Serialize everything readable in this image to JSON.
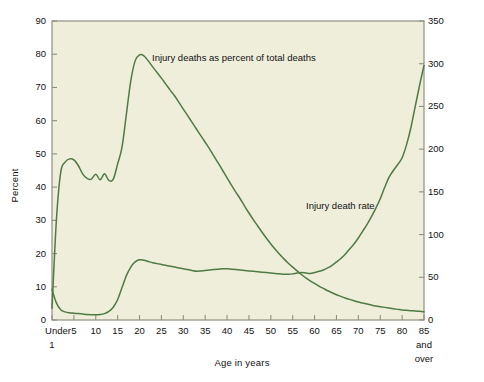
{
  "figure": {
    "background_color": "#ffffff",
    "plot_background_color": "#efeedb",
    "plot_border_color": "#8f8f82",
    "line_color": "#4e7a43"
  },
  "axes": {
    "left": {
      "title": "Percent",
      "ticks": [
        "0",
        "10",
        "20",
        "30",
        "40",
        "50",
        "60",
        "70",
        "80",
        "90"
      ],
      "min": 0,
      "max": 90
    },
    "right": {
      "title": "Deaths per 100,000 population",
      "ticks": [
        "0",
        "50",
        "100",
        "150",
        "200",
        "250",
        "300",
        "350"
      ],
      "min": 0,
      "max": 350
    },
    "bottom": {
      "title": "Age in years",
      "ticks": [
        "Under 1",
        "5",
        "10",
        "15",
        "20",
        "25",
        "30",
        "35",
        "40",
        "45",
        "50",
        "55",
        "60",
        "65",
        "70",
        "75",
        "80",
        "85 and over"
      ]
    }
  },
  "annotations": [
    {
      "name": "percent-series-label",
      "text": "Injury deaths as percent of total deaths"
    },
    {
      "name": "rate-series-label",
      "text": "Injury death rate"
    }
  ],
  "chart_data": {
    "type": "line",
    "title": "",
    "xlabel": "Age in years",
    "ylabel": "Percent",
    "ylabel_secondary": "Deaths per 100,000 population",
    "ylim": [
      0,
      90
    ],
    "ylim_secondary": [
      0,
      350
    ],
    "grid": false,
    "legend": "inline annotations",
    "x": [
      0,
      1,
      2,
      3,
      4,
      5,
      6,
      7,
      8,
      9,
      10,
      11,
      12,
      13,
      14,
      15,
      16,
      17,
      18,
      19,
      20,
      21,
      22,
      23,
      24,
      25,
      26,
      27,
      28,
      29,
      30,
      31,
      32,
      33,
      34,
      35,
      36,
      37,
      38,
      39,
      40,
      41,
      42,
      43,
      44,
      45,
      46,
      47,
      48,
      49,
      50,
      51,
      52,
      53,
      54,
      55,
      56,
      57,
      58,
      59,
      60,
      61,
      62,
      63,
      64,
      65,
      66,
      67,
      68,
      69,
      70,
      71,
      72,
      73,
      74,
      75,
      76,
      77,
      78,
      79,
      80,
      81,
      82,
      83,
      84,
      85
    ],
    "x_tick_labels": [
      "Under 1",
      "5",
      "10",
      "15",
      "20",
      "25",
      "30",
      "35",
      "40",
      "45",
      "50",
      "55",
      "60",
      "65",
      "70",
      "75",
      "80",
      "85 and over"
    ],
    "series": [
      {
        "name": "Injury deaths as percent of total deaths",
        "axis": "left",
        "units": "percent",
        "values": [
          3.5,
          30.0,
          44.5,
          47.5,
          48.5,
          48.2,
          46.5,
          44.0,
          42.6,
          42.4,
          43.9,
          42.2,
          44.0,
          42.0,
          42.4,
          47.0,
          52.0,
          62.0,
          72.0,
          78.0,
          79.8,
          79.5,
          78.0,
          76.2,
          74.5,
          72.8,
          71.0,
          69.2,
          67.5,
          65.5,
          63.5,
          61.5,
          59.5,
          57.5,
          55.5,
          53.5,
          51.5,
          49.3,
          47.2,
          45.0,
          42.8,
          40.6,
          38.5,
          36.5,
          34.3,
          32.2,
          30.2,
          28.3,
          26.4,
          24.6,
          22.9,
          21.3,
          19.8,
          18.4,
          17.1,
          15.9,
          14.8,
          13.7,
          12.7,
          11.8,
          11.0,
          10.2,
          9.5,
          8.8,
          8.2,
          7.6,
          7.1,
          6.6,
          6.2,
          5.8,
          5.4,
          5.1,
          4.8,
          4.5,
          4.2,
          4.0,
          3.8,
          3.6,
          3.4,
          3.2,
          3.0,
          2.9,
          2.8,
          2.7,
          2.6,
          2.5
        ]
      },
      {
        "name": "Injury death rate",
        "axis": "right",
        "units": "deaths per 100,000 population",
        "values": [
          36.0,
          20.0,
          12.0,
          9.5,
          8.5,
          8.0,
          7.5,
          7.0,
          6.5,
          6.2,
          6.0,
          6.4,
          7.5,
          10.0,
          15.0,
          24.0,
          38.0,
          52.0,
          62.0,
          68.0,
          70.5,
          70.0,
          68.5,
          67.0,
          66.0,
          65.0,
          64.0,
          63.0,
          62.0,
          61.0,
          60.0,
          59.0,
          58.0,
          57.0,
          57.5,
          58.0,
          58.5,
          59.0,
          59.5,
          60.0,
          60.0,
          59.5,
          59.0,
          58.5,
          58.0,
          57.5,
          57.0,
          56.5,
          56.0,
          55.5,
          55.0,
          54.5,
          54.0,
          53.5,
          53.5,
          54.0,
          55.0,
          55.5,
          55.0,
          54.5,
          55.5,
          57.0,
          58.5,
          61.0,
          64.0,
          68.0,
          72.0,
          77.0,
          83.0,
          89.0,
          96.0,
          104.0,
          112.0,
          121.0,
          131.0,
          142.0,
          155.0,
          167.0,
          175.0,
          182.0,
          190.0,
          205.0,
          225.0,
          250.0,
          275.0,
          298.0
        ]
      }
    ]
  }
}
